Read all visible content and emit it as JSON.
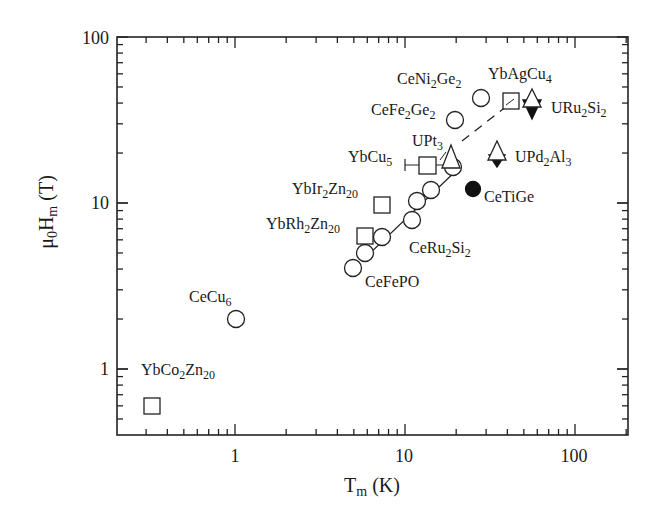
{
  "chart_data": {
    "type": "scatter",
    "title": "",
    "xlabel": "T_m (K)",
    "ylabel": "μ0H_m (T)",
    "xlabel_display": {
      "main": "T",
      "sub": "m",
      "unit": " (K)"
    },
    "ylabel_display": {
      "pre": "μ",
      "sub0": "0",
      "main": "H",
      "sub1": "m",
      "unit": " (T)"
    },
    "xscale": "log",
    "yscale": "log",
    "xlim": [
      0.2,
      200
    ],
    "ylim": [
      0.4,
      100
    ],
    "xticks": [
      1,
      10,
      100
    ],
    "xtick_labels": [
      "1",
      "10",
      "100"
    ],
    "yticks": [
      1,
      10,
      100
    ],
    "ytick_labels": [
      "1",
      "10",
      "100"
    ],
    "grid": false,
    "legend": null,
    "series": [
      {
        "name": "Ce-based (open circles)",
        "marker": "circle-open",
        "points": [
          {
            "label": "CeCu6",
            "x": 1.0,
            "y": 2.0
          },
          {
            "label": "CeFePO",
            "x": 5.0,
            "y": 4.0
          },
          {
            "label": "CeRu2Si2",
            "x": 5.8,
            "y": 5.0
          },
          {
            "label": "CeRu2Si2",
            "x": 7.3,
            "y": 6.2
          },
          {
            "label": "CeRu2Si2",
            "x": 11.0,
            "y": 7.9
          },
          {
            "label": "CeRu2Si2",
            "x": 11.8,
            "y": 10.3
          },
          {
            "label": "CeRu2Si2",
            "x": 14.2,
            "y": 12.0
          },
          {
            "label": "CeRu2Si2",
            "x": 19.2,
            "y": 16.5
          },
          {
            "label": "CeFe2Ge2",
            "x": 19.7,
            "y": 31.6
          },
          {
            "label": "CeNi2Ge2",
            "x": 28.0,
            "y": 43.0
          }
        ]
      },
      {
        "name": "Yb-based (open squares)",
        "marker": "square-open",
        "points": [
          {
            "label": "YbCo2Zn20",
            "x": 0.33,
            "y": 0.6
          },
          {
            "label": "YbRh2Zn20",
            "x": 5.8,
            "y": 6.3
          },
          {
            "label": "YbIr2Zn20",
            "x": 7.3,
            "y": 9.7
          },
          {
            "label": "YbCu5",
            "x": 13.7,
            "y": 16.9,
            "xerr": [
              10.0,
              17.2
            ]
          },
          {
            "label": "YbAgCu4",
            "x": 42.0,
            "y": 41.0
          }
        ]
      },
      {
        "name": "U-based (open up-triangles)",
        "marker": "triangle-up-open",
        "points": [
          {
            "label": "UPt3",
            "x": 18.6,
            "y": 18.6
          },
          {
            "label": "UPd2Al3",
            "x": 35.0,
            "y": 21.0
          },
          {
            "label": "URu2Si2",
            "x": 56.0,
            "y": 43.0
          }
        ]
      },
      {
        "name": "U-based (filled down-triangles)",
        "marker": "triangle-down-filled",
        "points": [
          {
            "label": "UPd2Al3",
            "x": 35.0,
            "y": 17.7
          },
          {
            "label": "URu2Si2",
            "x": 56.0,
            "y": 35.8
          }
        ]
      },
      {
        "name": "CeTiGe (filled circle)",
        "marker": "circle-filled",
        "points": [
          {
            "label": "CeTiGe",
            "x": 25.0,
            "y": 12.1
          }
        ]
      }
    ],
    "lines": [
      {
        "style": "solid",
        "from": {
          "x": 5.8,
          "y": 4.6
        },
        "to": {
          "x": 21.5,
          "y": 16.8
        }
      },
      {
        "style": "dashed",
        "from": {
          "x": 22.0,
          "y": 27.0
        },
        "to": {
          "x": 45.0,
          "y": 40.0
        }
      }
    ],
    "annotations": [
      {
        "text": "CeNi2Ge2",
        "parts": [
          [
            "CeNi",
            ""
          ],
          [
            "2",
            "sub"
          ],
          [
            "Ge",
            ""
          ],
          [
            "2",
            "sub"
          ]
        ]
      },
      {
        "text": "YbAgCu4"
      },
      {
        "text": "CeFe2Ge2"
      },
      {
        "text": "URu2Si2"
      },
      {
        "text": "UPt3"
      },
      {
        "text": "YbCu5"
      },
      {
        "text": "UPd2Al3"
      },
      {
        "text": "YbIr2Zn20"
      },
      {
        "text": "CeTiGe"
      },
      {
        "text": "YbRh2Zn20"
      },
      {
        "text": "CeRu2Si2"
      },
      {
        "text": "CeFePO"
      },
      {
        "text": "CeCu6"
      },
      {
        "text": "YbCo2Zn20"
      }
    ]
  },
  "labels": {
    "CeNi2Ge2": {
      "a": "CeNi",
      "b": "2",
      "c": "Ge",
      "d": "2"
    },
    "YbAgCu4": {
      "a": "YbAgCu",
      "b": "4"
    },
    "CeFe2Ge2": {
      "a": "CeFe",
      "b": "2",
      "c": "Ge",
      "d": "2"
    },
    "URu2Si2": {
      "a": "URu",
      "b": "2",
      "c": "Si",
      "d": "2"
    },
    "UPt3": {
      "a": "UPt",
      "b": "3"
    },
    "YbCu5": {
      "a": "YbCu",
      "b": "5"
    },
    "UPd2Al3": {
      "a": "UPd",
      "b": "2",
      "c": "Al",
      "d": "3"
    },
    "YbIr2Zn20": {
      "a": "YbIr",
      "b": "2",
      "c": "Zn",
      "d": "20"
    },
    "CeTiGe": {
      "a": "CeTiGe"
    },
    "YbRh2Zn20": {
      "a": "YbRh",
      "b": "2",
      "c": "Zn",
      "d": "20"
    },
    "CeRu2Si2": {
      "a": "CeRu",
      "b": "2",
      "c": "Si",
      "d": "2"
    },
    "CeFePO": {
      "a": "CeFePO"
    },
    "CeCu6": {
      "a": "CeCu",
      "b": "6"
    },
    "YbCo2Zn20": {
      "a": "YbCo",
      "b": "2",
      "c": "Zn",
      "d": "20"
    }
  }
}
